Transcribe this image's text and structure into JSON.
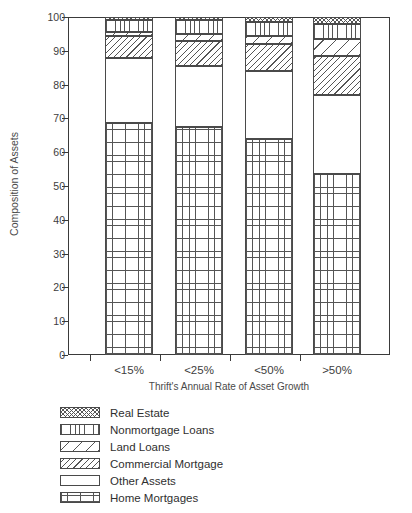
{
  "chart_data": {
    "type": "bar",
    "subtype": "stacked-bar-100-percent",
    "title": "",
    "xlabel": "Thrift's Annual Rate of Asset Growth",
    "ylabel": "Composition of Assets",
    "categories": [
      "<15%",
      "<25%",
      "<50%",
      ">50%"
    ],
    "ylim": [
      0,
      100
    ],
    "yticks": [
      0,
      10,
      20,
      30,
      40,
      50,
      60,
      70,
      80,
      90,
      100
    ],
    "ytick_labels": [
      "0",
      "10",
      "20",
      "30",
      "40",
      "50",
      "60",
      "70",
      "80",
      "90",
      "100"
    ],
    "grid": false,
    "legend_position": "below-plot",
    "stack_order_bottom_to_top": [
      "Home Mortgages",
      "Other Assets",
      "Commercial Mortgage",
      "Land Loans",
      "Nonmortgage Loans",
      "Real Estate"
    ],
    "series": [
      {
        "name": "Home Mortgages",
        "pattern": "grid",
        "values": [
          68.5,
          67.5,
          64.0,
          53.5
        ],
        "cumulative_top": [
          68.5,
          67.5,
          64.0,
          53.5
        ]
      },
      {
        "name": "Other Assets",
        "pattern": "blank",
        "values": [
          19.5,
          18.0,
          20.0,
          23.5
        ],
        "cumulative_top": [
          88.0,
          85.5,
          84.0,
          77.0
        ]
      },
      {
        "name": "Commercial Mortgage",
        "pattern": "dense-diagonal",
        "values": [
          6.3,
          7.5,
          8.0,
          11.5
        ],
        "cumulative_top": [
          94.3,
          93.0,
          92.0,
          88.5
        ]
      },
      {
        "name": "Land Loans",
        "pattern": "sparse-diagonal",
        "values": [
          1.2,
          2.0,
          2.5,
          5.0
        ],
        "cumulative_top": [
          95.5,
          95.0,
          94.5,
          93.5
        ]
      },
      {
        "name": "Nonmortgage Loans",
        "pattern": "vertical-lines",
        "values": [
          3.5,
          4.0,
          4.0,
          4.5
        ],
        "cumulative_top": [
          99.0,
          99.0,
          98.5,
          98.0
        ]
      },
      {
        "name": "Real Estate",
        "pattern": "fine-crosshatch",
        "values": [
          1.0,
          1.0,
          1.5,
          2.0
        ],
        "cumulative_top": [
          100.0,
          100.0,
          100.0,
          100.0
        ]
      }
    ]
  },
  "axes": {
    "y_title": "Composition of Assets",
    "x_title": "Thrift's Annual Rate of Asset Growth",
    "y_ticks": [
      "100",
      "90",
      "80",
      "70",
      "60",
      "50",
      "40",
      "30",
      "20",
      "10",
      "0"
    ],
    "x_ticks": [
      "<15%",
      "<25%",
      "<50%",
      ">50%"
    ]
  },
  "legend": {
    "items": [
      {
        "label": "Real Estate",
        "pattern": "fine-crosshatch"
      },
      {
        "label": "Nonmortgage Loans",
        "pattern": "vertical-lines"
      },
      {
        "label": "Land Loans",
        "pattern": "sparse-diagonal"
      },
      {
        "label": "Commercial Mortgage",
        "pattern": "dense-diagonal"
      },
      {
        "label": "Other Assets",
        "pattern": "blank"
      },
      {
        "label": "Home Mortgages",
        "pattern": "grid"
      }
    ]
  },
  "colors": {
    "background": "#ffffff",
    "ink": "#3a3a3a",
    "pattern_stroke": "#555555"
  }
}
